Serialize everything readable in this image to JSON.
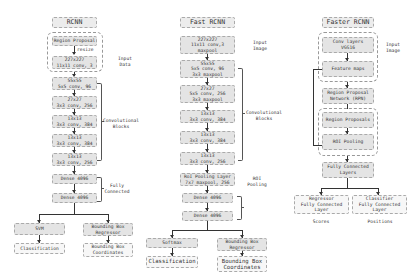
{
  "rcnn": {
    "title": "RCNN",
    "region_proposal": "Region Proposal",
    "resize": "resize",
    "input_box": [
      "227x227",
      "11x11 conv, 3"
    ],
    "conv_blocks": [
      [
        "55x55",
        "5x5 conv, 96"
      ],
      [
        "27x27",
        "3x3 conv, 256"
      ],
      [
        "13x13",
        "3x3 conv, 384"
      ],
      [
        "13x13",
        "3x3 conv, 384"
      ],
      [
        "13x13",
        "3x3 conv, 256"
      ]
    ],
    "dense": [
      "Dense 4096",
      "Dense 4096"
    ],
    "svm": "SVM",
    "bbox_regressor": "Bounding Box Regressor",
    "classification": "Classification",
    "bbox_coords": "Bounding Box Coordinates",
    "labels": {
      "input": "Input Data",
      "conv": "Convolutional Blocks",
      "fc": "Fully Connected"
    }
  },
  "fast_rcnn": {
    "title": "Fast RCNN",
    "input_box": [
      "227x227",
      "11x11 conv,3",
      "maxpool"
    ],
    "conv_blocks": [
      [
        "55x55",
        "5x5 conv, 96",
        "3x3 maxpool"
      ],
      [
        "27x27",
        "5x5 conv, 256",
        "3x3 maxpool"
      ],
      [
        "13x13",
        "3x3 conv, 384"
      ],
      [
        "13x13",
        "3x3 conv, 384"
      ],
      [
        "13x13",
        "3x3 conv, 256"
      ]
    ],
    "roi_layer": [
      "RoI Pooling Layer",
      "7x7 maxpool, 256"
    ],
    "dense": [
      "Dense 4096",
      "Dense 4096"
    ],
    "softmax": "Softmax",
    "bbox_regressor": "Bounding Box Regressor",
    "classification": "Classification",
    "bbox_coords": "Bounding Box Coordinates",
    "labels": {
      "input": "Input Image",
      "conv": "Convolutional Blocks",
      "roi": "ROI Pooling"
    }
  },
  "faster_rcnn": {
    "title": "Faster RCNN",
    "conv_layers": [
      "Conv layers",
      "VGG16"
    ],
    "feature_maps": "Feature maps",
    "rpn": [
      "Region Proposal",
      "Network (RPN)"
    ],
    "region_proposals": "Region Proposals",
    "roi_pooling": "ROI Pooling",
    "fc_layers": [
      "Fully Connected",
      "Layers"
    ],
    "regressor": [
      "Regressor",
      "Fully Connected",
      "Layer"
    ],
    "classifier": [
      "Classifier",
      "Fully Connected",
      "Layer"
    ],
    "scores": "Scores",
    "positions": "Positions",
    "labels": {
      "input": "Input Image"
    }
  }
}
